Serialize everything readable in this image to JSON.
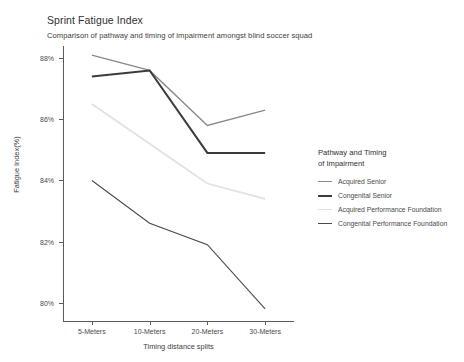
{
  "chart_data": {
    "type": "line",
    "title": "Sprint Fatigue Index",
    "subtitle": "Comparison of pathway and timing of impairment amongst blind soccer squad",
    "xlabel": "Timing distance splits",
    "ylabel": "Fatigue Index(%)",
    "categories": [
      "5-Meters",
      "10-Meters",
      "20-Meters",
      "30-Meters"
    ],
    "ytick_labels": [
      "88%",
      "86%",
      "84%",
      "82%",
      "80%"
    ],
    "ytick_values": [
      88,
      86,
      84,
      82,
      80
    ],
    "ylim": [
      79.4,
      88.4
    ],
    "grid": false,
    "legend_position": "right",
    "legend_title": "Pathway and Timing\nof Impairment",
    "series": [
      {
        "name": "Acquired Senior",
        "color": "#8a8a8a",
        "width": 1.4,
        "values": [
          88.1,
          87.6,
          85.8,
          86.3
        ]
      },
      {
        "name": "Congenital Senior",
        "color": "#3b3b3b",
        "width": 2.0,
        "values": [
          87.4,
          87.6,
          84.9,
          84.9
        ]
      },
      {
        "name": "Acquired Performance Foundation",
        "color": "#e2e2e2",
        "width": 1.8,
        "values": [
          86.5,
          85.2,
          83.9,
          83.4
        ]
      },
      {
        "name": "Congenital Performance Foundation",
        "color": "#4a4a4a",
        "width": 1.1,
        "values": [
          84.0,
          82.6,
          81.9,
          79.8
        ]
      }
    ]
  }
}
